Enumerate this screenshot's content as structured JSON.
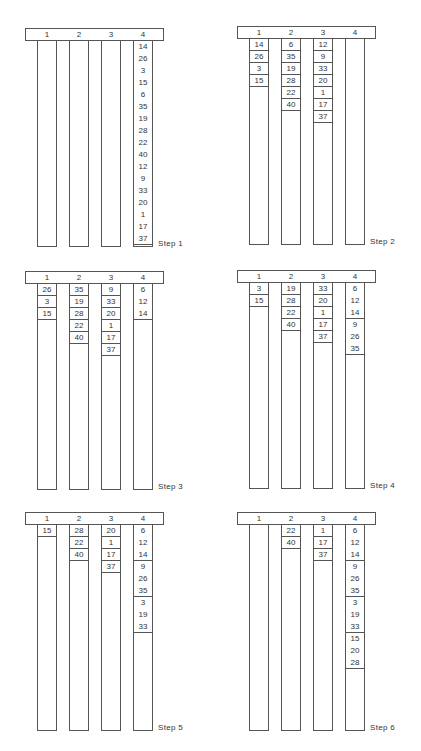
{
  "figure": {
    "column_headers": [
      "1",
      "2",
      "3",
      "4"
    ],
    "steps": [
      {
        "label": "Step 1",
        "columns": [
          {
            "values": []
          },
          {
            "values": []
          },
          {
            "values": []
          },
          {
            "values": [
              "14",
              "26",
              "3",
              "15",
              "6",
              "35",
              "19",
              "28",
              "22",
              "40",
              "12",
              "9",
              "33",
              "20",
              "1",
              "17",
              "37"
            ],
            "groups": [
              17
            ]
          }
        ]
      },
      {
        "label": "Step 2",
        "columns": [
          {
            "values": [
              "14",
              "26",
              "3",
              "15"
            ]
          },
          {
            "values": [
              "6",
              "35",
              "19",
              "28",
              "22",
              "40"
            ]
          },
          {
            "values": [
              "12",
              "9",
              "33",
              "20",
              "1",
              "17",
              "37"
            ]
          },
          {
            "values": []
          }
        ]
      },
      {
        "label": "Step 3",
        "columns": [
          {
            "values": [
              "26",
              "3",
              "15"
            ]
          },
          {
            "values": [
              "35",
              "19",
              "28",
              "22",
              "40"
            ]
          },
          {
            "values": [
              "9",
              "33",
              "20",
              "1",
              "17",
              "37"
            ]
          },
          {
            "values": [
              "6",
              "12",
              "14"
            ],
            "groups": [
              3
            ]
          }
        ]
      },
      {
        "label": "Step 4",
        "columns": [
          {
            "values": [
              "3",
              "15"
            ]
          },
          {
            "values": [
              "19",
              "28",
              "22",
              "40"
            ]
          },
          {
            "values": [
              "33",
              "20",
              "1",
              "17",
              "37"
            ]
          },
          {
            "values": [
              "6",
              "12",
              "14",
              "9",
              "26",
              "35"
            ],
            "groups": [
              3,
              3
            ]
          }
        ]
      },
      {
        "label": "Step 5",
        "columns": [
          {
            "values": [
              "15"
            ]
          },
          {
            "values": [
              "28",
              "22",
              "40"
            ]
          },
          {
            "values": [
              "20",
              "1",
              "17",
              "37"
            ]
          },
          {
            "values": [
              "6",
              "12",
              "14",
              "9",
              "26",
              "35",
              "3",
              "19",
              "33"
            ],
            "groups": [
              3,
              3,
              3
            ]
          }
        ]
      },
      {
        "label": "Step 6",
        "columns": [
          {
            "values": []
          },
          {
            "values": [
              "22",
              "40"
            ]
          },
          {
            "values": [
              "1",
              "17",
              "37"
            ]
          },
          {
            "values": [
              "6",
              "12",
              "14",
              "9",
              "26",
              "35",
              "3",
              "19",
              "33",
              "15",
              "20",
              "28"
            ],
            "groups": [
              3,
              3,
              3,
              3
            ]
          }
        ]
      }
    ]
  },
  "colors": {
    "line": "#555555",
    "text": "#333333",
    "background": "#ffffff"
  }
}
